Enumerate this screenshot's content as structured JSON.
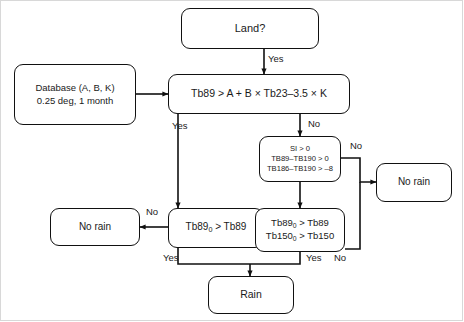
{
  "diagram": {
    "background_color": "#ffffff",
    "line_color": "#111111",
    "text_color": "#1a1a1a"
  },
  "nodes": {
    "land": {
      "label": "Land?",
      "shape": "rounded-rect"
    },
    "database": {
      "line1": "Database (A, B, K)",
      "line2": "0.25 deg, 1 month",
      "shape": "rounded-rect"
    },
    "main_test": {
      "label": "Tb89 > A + B × Tb23–3.5 × K",
      "shape": "rounded-rect"
    },
    "si_test": {
      "line1": "SI > 0",
      "line2": "TB89–TB190 > 0",
      "line3": "TB186–TB190 > –8",
      "shape": "rounded-rect"
    },
    "tb89_test": {
      "label_prefix": "Tb89",
      "label_sub": "0",
      "label_suffix": " > Tb89",
      "shape": "rounded-rect"
    },
    "tb89_tb150_test": {
      "line1_prefix": "Tb89",
      "line1_sub": "0",
      "line1_suffix": " > Tb89",
      "line2_prefix": "Tb150",
      "line2_sub": "0",
      "line2_suffix": " > Tb150",
      "shape": "rounded-rect"
    },
    "no_rain_left": {
      "label": "No rain",
      "shape": "rounded-rect"
    },
    "no_rain_right": {
      "label": "No rain",
      "shape": "rounded-rect"
    },
    "rain": {
      "label": "Rain",
      "shape": "rounded-rect"
    }
  },
  "edge_labels": {
    "land_yes": "Yes",
    "main_yes": "Yes",
    "main_no": "No",
    "si_no": "No",
    "tb89_no": "No",
    "tb89_yes": "Yes",
    "tb89_tb150_no": "No",
    "tb89_tb150_yes": "Yes"
  }
}
